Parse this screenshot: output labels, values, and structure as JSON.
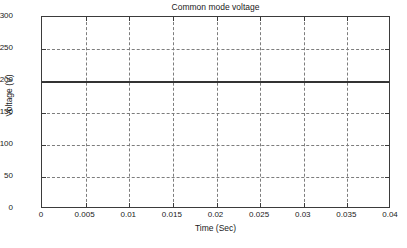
{
  "chart_data": {
    "type": "line",
    "title": "Common mode voltage",
    "xlabel": "Time (Sec)",
    "ylabel": "Voltage (V)",
    "xlim": [
      0,
      0.04
    ],
    "ylim": [
      0,
      300
    ],
    "grid": true,
    "legend": null,
    "xticks": [
      0,
      0.005,
      0.01,
      0.015,
      0.02,
      0.025,
      0.03,
      0.035,
      0.04
    ],
    "xticklabels": [
      "0",
      "0.005",
      "0.01",
      "0.015",
      "0.02",
      "0.025",
      "0.03",
      "0.035",
      "0.04"
    ],
    "yticks": [
      0,
      50,
      100,
      150,
      200,
      250,
      300
    ],
    "yticklabels": [
      "0",
      "50",
      "100",
      "150",
      "200",
      "250",
      "300"
    ],
    "series": [
      {
        "name": "Common mode voltage",
        "color": "#333333",
        "linewidth": 2,
        "x": [
          0,
          0.005,
          0.01,
          0.015,
          0.02,
          0.025,
          0.03,
          0.035,
          0.04
        ],
        "values": [
          200,
          200,
          200,
          200,
          200,
          200,
          200,
          200,
          200
        ]
      }
    ],
    "annotations": []
  },
  "style": {
    "background": "#ffffff",
    "axis_color": "#3b3b3b",
    "grid_color": "#7d7d7d",
    "text_color": "#1a1a1a"
  }
}
